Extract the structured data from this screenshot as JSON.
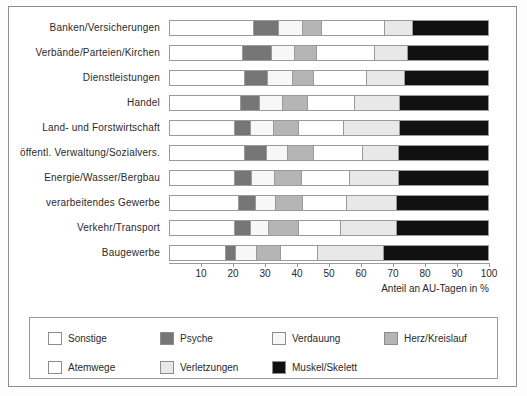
{
  "chart_data": {
    "type": "bar",
    "subtype": "stacked-horizontal-100pct",
    "title": "",
    "xlabel": "Anteil an AU-Tagen in %",
    "ylabel": "",
    "xlim": [
      0,
      100
    ],
    "xticks": [
      10,
      20,
      30,
      40,
      50,
      60,
      70,
      80,
      90,
      100
    ],
    "grid": false,
    "legend_position": "bottom",
    "categories": [
      "Banken/Versicherungen",
      "Verbände/Parteien/Kirchen",
      "Dienstleistungen",
      "Handel",
      "Land- und Forstwirtschaft",
      "öffentl. Verwaltung/Sozialvers.",
      "Energie/Wasser/Bergbau",
      "verarbeitendes Gewerbe",
      "Verkehr/Transport",
      "Baugewerbe"
    ],
    "series": [
      {
        "name": "Sonstige",
        "color": "#ffffff",
        "values": [
          26.6,
          23.1,
          23.8,
          22.4,
          20.6,
          23.8,
          20.5,
          21.7,
          20.4,
          17.5
        ]
      },
      {
        "name": "Psyche",
        "color": "#767676",
        "values": [
          7.8,
          8.8,
          6.9,
          5.7,
          4.7,
          6.7,
          5.3,
          5.2,
          4.9,
          3.1
        ]
      },
      {
        "name": "Verdauung",
        "color": "#f7f7f7",
        "values": [
          7.2,
          7.2,
          7.6,
          7.3,
          7.2,
          6.5,
          6.8,
          6.2,
          5.4,
          6.3
        ]
      },
      {
        "name": "Herz/Kreislauf",
        "color": "#b5b5b5",
        "values": [
          5.9,
          6.8,
          6.5,
          7.5,
          7.6,
          7.8,
          8.5,
          8.4,
          9.4,
          7.5
        ]
      },
      {
        "name": "Atemwege",
        "color": "#ffffff",
        "values": [
          19.7,
          18.2,
          16.7,
          14.9,
          14.1,
          15.4,
          14.9,
          13.7,
          13.0,
          11.4
        ]
      },
      {
        "name": "Verletzungen",
        "color": "#e8e8e8",
        "values": [
          8.7,
          10.3,
          11.9,
          14.1,
          17.7,
          11.2,
          15.4,
          15.6,
          17.7,
          20.9
        ]
      },
      {
        "name": "Muskel/Skelett",
        "color": "#111111",
        "values": [
          24.1,
          25.6,
          26.6,
          28.1,
          28.1,
          28.6,
          28.6,
          29.2,
          29.2,
          33.3
        ]
      }
    ]
  },
  "legend": {
    "rows": [
      [
        {
          "label": "Sonstige",
          "color": "#ffffff",
          "swatch": "legend-swatch-sonstige"
        },
        {
          "label": "Psyche",
          "color": "#767676",
          "swatch": "legend-swatch-psyche"
        },
        {
          "label": "Verdauung",
          "color": "#f7f7f7",
          "swatch": "legend-swatch-verdauung"
        },
        {
          "label": "Herz/Kreislauf",
          "color": "#b5b5b5",
          "swatch": "legend-swatch-herz-kreislauf"
        }
      ],
      [
        {
          "label": "Atemwege",
          "color": "#ffffff",
          "swatch": "legend-swatch-atemwege"
        },
        {
          "label": "Verletzungen",
          "color": "#e8e8e8",
          "swatch": "legend-swatch-verletzungen"
        },
        {
          "label": "Muskel/Skelett",
          "color": "#111111",
          "swatch": "legend-swatch-muskel-skelett"
        }
      ]
    ]
  },
  "colors": {
    "frame": "#8d8d8d",
    "axis": "#9a9a9a",
    "text": "#2a2a2a",
    "background": "#ffffff"
  }
}
